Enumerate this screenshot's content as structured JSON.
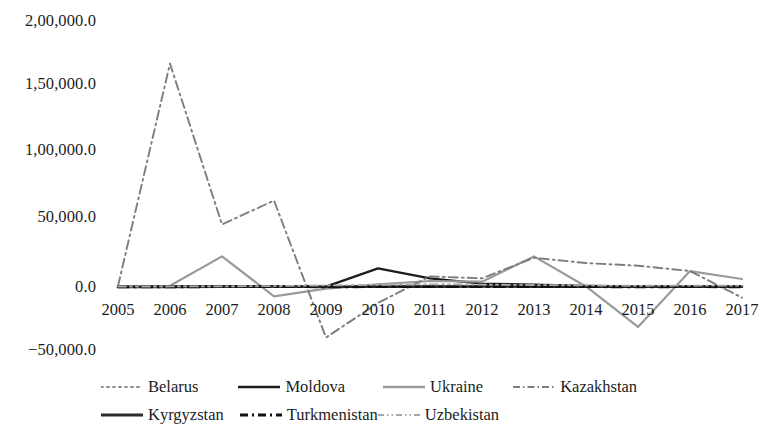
{
  "chart_data": {
    "type": "line",
    "title": "",
    "subtitle": "",
    "xlabel": "",
    "ylabel": "",
    "grid": false,
    "legend_position": "bottom",
    "categories": [
      "2005",
      "2006",
      "2007",
      "2008",
      "2009",
      "2010",
      "2011",
      "2012",
      "2013",
      "2014",
      "2015",
      "2016",
      "2017"
    ],
    "y_ticks": [
      "2,00,000.0",
      "1,50,000.0",
      "1,00,000.0",
      "50,000.0",
      "0.0",
      "−50,000.0"
    ],
    "y_tick_values": [
      200000,
      150000,
      100000,
      50000,
      0,
      -50000
    ],
    "ylim": [
      -50000,
      200000
    ],
    "series": [
      {
        "name": "Belarus",
        "style": "dotted",
        "color": "#8c8c8c",
        "width": 1.6,
        "values": [
          100,
          200,
          400,
          600,
          200,
          500,
          900,
          700,
          600,
          400,
          200,
          300,
          400
        ]
      },
      {
        "name": "Moldova",
        "style": "solid",
        "color": "#1c1c1c",
        "width": 2.4,
        "values": [
          200,
          300,
          400,
          600,
          300,
          14000,
          6500,
          2500,
          1800,
          700,
          400,
          500,
          400
        ]
      },
      {
        "name": "Ukraine",
        "style": "solid",
        "color": "#9a9a9a",
        "width": 2.2,
        "values": [
          600,
          900,
          23000,
          -7000,
          -1200,
          2000,
          4500,
          4000,
          23000,
          400,
          -30000,
          12000,
          6000
        ]
      },
      {
        "name": "Kazakhstan",
        "style": "dash-dot",
        "color": "#7d7d7d",
        "width": 1.9,
        "values": [
          700,
          168000,
          47000,
          65000,
          -38000,
          -12000,
          8000,
          6500,
          22000,
          18000,
          16000,
          12000,
          -8000
        ]
      },
      {
        "name": "Kyrgyzstan",
        "style": "solid",
        "color": "#2a2a2a",
        "width": 2.6,
        "values": [
          50,
          100,
          200,
          350,
          150,
          250,
          300,
          350,
          300,
          250,
          200,
          250,
          200
        ]
      },
      {
        "name": "Turkmenistan",
        "style": "long-dash-dot",
        "color": "#111111",
        "width": 2.6,
        "values": [
          0,
          100,
          150,
          200,
          100,
          150,
          200,
          250,
          200,
          150,
          100,
          150,
          100
        ]
      },
      {
        "name": "Uzbekistan",
        "style": "dash-dot-dot",
        "color": "#a8a8a8",
        "width": 1.8,
        "values": [
          300,
          400,
          500,
          700,
          1200,
          1600,
          2000,
          1800,
          1500,
          1200,
          900,
          1100,
          1000
        ]
      }
    ]
  },
  "legend": {
    "row_1": [
      "Belarus",
      "Moldova",
      "Ukraine",
      "Kazakhstan"
    ],
    "row_2": [
      "Kyrgyzstan",
      "Turkmenistan",
      "Uzbekistan"
    ]
  }
}
